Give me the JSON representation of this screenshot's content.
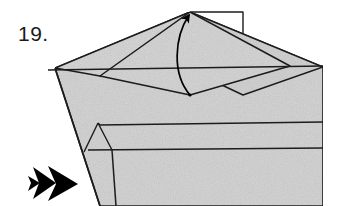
{
  "diagram": {
    "kind": "origami-folding-instruction",
    "step_label": "19.",
    "paper_fill": "#d4d4d4",
    "paper_fill_light": "#dcdcdc",
    "line_color": "#1c1c1c",
    "background": "#ffffff",
    "arrow_color": "#000000",
    "icons": {
      "fold_arrow": "curved-fold-arrow-icon",
      "direction_arrow": "double-chevron-arrow-icon"
    },
    "annotations": {
      "fold_arrow_label": "fold the flap upward",
      "direction_arrow_label": "view / turn direction"
    },
    "shapes": {
      "back_rectangle": "190,12 243,12 243,95 190,95",
      "main_body": "55,68 190,12 323,67 323,206 100,206",
      "upper_left_flap": "55,68 190,12 243,64 100,76",
      "upper_right_flap": "190,12 323,67 243,95 190,70",
      "center_diamond": "100,76 190,12 290,66 190,95",
      "crease_horizontal_upper": "48,70 323,66",
      "crease_band_1": "100,125 323,122",
      "crease_band_2": "88,150 323,148",
      "small_triangle": "98,122 112,150 84,152"
    }
  }
}
